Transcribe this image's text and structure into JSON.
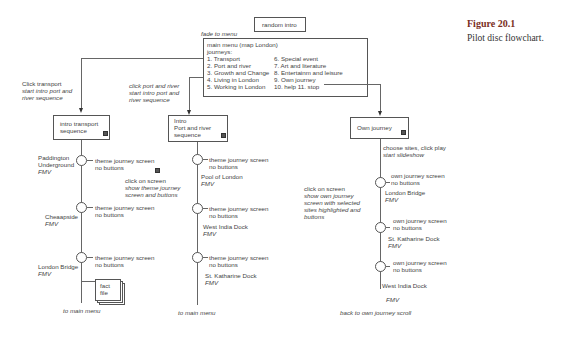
{
  "caption": {
    "figure": "Figure 20.1",
    "text": "Pilot disc flowchart."
  },
  "top": {
    "random_intro": "random intro",
    "fade_label": "fade to menu",
    "menu_title": "main menu (map London)",
    "menu_subtitle": "journeys:",
    "menu_left": [
      "1. Transport",
      "2. Port and river",
      "3. Growth and Change",
      "4. Living in London",
      "5. Working in London"
    ],
    "menu_right": [
      "6. Special event",
      "7. Art and literature",
      "8. Entertainm and leisure",
      "9. Own journey",
      "10. help  11. stop"
    ]
  },
  "branch_transport": {
    "label1": "Click transport",
    "label2": "start intro port and",
    "label3": "river sequence",
    "box": [
      "intro transport",
      "sequence"
    ],
    "nodes": [
      {
        "place": [
          "Paddington",
          "Underground"
        ],
        "fmv": "FMV",
        "screen": "theme journey screen",
        "buttons": "no buttons"
      },
      {
        "place": [
          "Cheaapside"
        ],
        "fmv": "FMV",
        "screen": "theme journey screen",
        "buttons": "no buttons"
      },
      {
        "place": [
          "London Bridge"
        ],
        "fmv": "FMV",
        "screen": "theme journey screen",
        "buttons": "no buttons"
      }
    ],
    "fact_file": [
      "fact",
      "file"
    ],
    "end": "to main menu"
  },
  "click_note": {
    "line1": "click on screen",
    "line2": "show theme journey",
    "line3": "screen and buttons"
  },
  "branch_port": {
    "label1": "click port and river",
    "label2": "start intro port and",
    "label3": "river sequence",
    "box": [
      "Intro",
      "Port and river",
      "sequence"
    ],
    "nodes": [
      {
        "place": "Pool of London",
        "fmv": "FMV",
        "screen": "theme journey screen",
        "buttons": "no buttons"
      },
      {
        "place": "West India Dock",
        "fmv": "FMV",
        "screen": "theme journey screen",
        "buttons": "no buttons"
      },
      {
        "place": "St. Katharine Dock",
        "fmv": "FMV",
        "screen": "theme journey screen",
        "buttons": "no buttons"
      }
    ],
    "end": "to main menu"
  },
  "branch_own": {
    "box": "Own journey",
    "label1": "choose sites, click play",
    "label2": "start slideshow",
    "note": [
      "click on screen",
      "show own journey",
      "screen with selected",
      "sites highlighted and",
      "buttons"
    ],
    "nodes": [
      {
        "place": "London Bridge",
        "fmv": "FMV",
        "screen": "own journey screen",
        "buttons": "no buttons"
      },
      {
        "place": "St. Katharine Dock",
        "fmv": "FMV",
        "screen": "own journey screen",
        "buttons": "no buttons"
      },
      {
        "place": "West India Dock",
        "fmv": "FMV",
        "screen": "own journey screen",
        "buttons": "no buttons"
      }
    ],
    "end": "back to own journey scroll"
  }
}
